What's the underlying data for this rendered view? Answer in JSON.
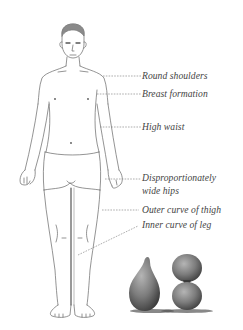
{
  "diagram": {
    "labels": [
      {
        "id": "round-shoulders",
        "text": "Round shoulders"
      },
      {
        "id": "breast-formation",
        "text": "Breast formation"
      },
      {
        "id": "high-waist",
        "text": "High waist"
      },
      {
        "id": "wide-hips-line1",
        "text": "Disproportionately"
      },
      {
        "id": "wide-hips-line2",
        "text": "wide hips"
      },
      {
        "id": "outer-curve-thigh",
        "text": "Outer curve of thigh"
      },
      {
        "id": "inner-curve-leg",
        "text": "Inner curve of leg"
      }
    ],
    "shapes": [
      {
        "id": "pear-shape",
        "description": "pear-shaped 3D object"
      },
      {
        "id": "hourglass-shape",
        "description": "hourglass-shaped 3D object"
      }
    ],
    "colors": {
      "background": "#ffffff",
      "line": "#555555",
      "text": "#444444",
      "hair": "#8a8a8a",
      "shape_fill": "#7a7a7a"
    }
  }
}
